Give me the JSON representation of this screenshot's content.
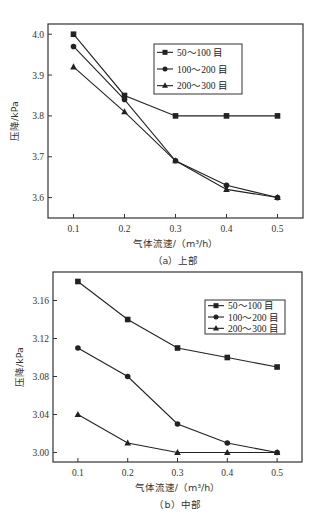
{
  "chart_data": [
    {
      "type": "line",
      "panel": "a",
      "caption": "（a）上部",
      "xlabel": "气体流速/（m³/h）",
      "ylabel": "压降/kPa",
      "x": [
        0.1,
        0.2,
        0.3,
        0.4,
        0.5
      ],
      "xticks": [
        "0.1",
        "0.2",
        "0.3",
        "0.4",
        "0.5"
      ],
      "yticks": [
        "3.6",
        "3.7",
        "3.8",
        "3.9",
        "4.0"
      ],
      "ytick_values": [
        3.6,
        3.7,
        3.8,
        3.9,
        4.0
      ],
      "xlim": [
        0.05,
        0.55
      ],
      "ylim": [
        3.55,
        4.025
      ],
      "grid": false,
      "legend_position": "upper right",
      "series": [
        {
          "name": "50～100 目",
          "marker": "square",
          "values": [
            4.0,
            3.85,
            3.8,
            3.8,
            3.8
          ]
        },
        {
          "name": "100～200 目",
          "marker": "circle",
          "values": [
            3.97,
            3.84,
            3.69,
            3.63,
            3.6
          ]
        },
        {
          "name": "200～300 目",
          "marker": "triangle",
          "values": [
            3.92,
            3.81,
            3.69,
            3.62,
            3.6
          ]
        }
      ]
    },
    {
      "type": "line",
      "panel": "b",
      "caption": "（b）中部",
      "xlabel": "气体流速/（m³/h）",
      "ylabel": "压降/kPa",
      "x": [
        0.1,
        0.2,
        0.3,
        0.4,
        0.5
      ],
      "xticks": [
        "0.1",
        "0.2",
        "0.3",
        "0.4",
        "0.5"
      ],
      "yticks": [
        "3.00",
        "3.04",
        "3.08",
        "3.12",
        "3.16"
      ],
      "ytick_values": [
        3.0,
        3.04,
        3.08,
        3.12,
        3.16
      ],
      "xlim": [
        0.05,
        0.55
      ],
      "ylim": [
        2.99,
        3.19
      ],
      "grid": false,
      "legend_position": "upper right",
      "series": [
        {
          "name": "50～100 目",
          "marker": "square",
          "values": [
            3.18,
            3.14,
            3.11,
            3.1,
            3.09
          ]
        },
        {
          "name": "100～200 目",
          "marker": "circle",
          "values": [
            3.11,
            3.08,
            3.03,
            3.01,
            3.0
          ]
        },
        {
          "name": "200～300 目",
          "marker": "triangle",
          "values": [
            3.04,
            3.01,
            3.0,
            3.0,
            3.0
          ]
        }
      ]
    }
  ],
  "layout": {
    "panels": [
      {
        "left": 48,
        "top": 24,
        "right": 303,
        "bottom": 218,
        "legend": {
          "x": 154,
          "y": 44,
          "w": 88,
          "h": 50
        }
      },
      {
        "left": 53,
        "top": 272,
        "right": 302,
        "bottom": 462,
        "legend": {
          "x": 205,
          "y": 300,
          "w": 80,
          "h": 34
        }
      }
    ],
    "line_color": "#222222"
  }
}
